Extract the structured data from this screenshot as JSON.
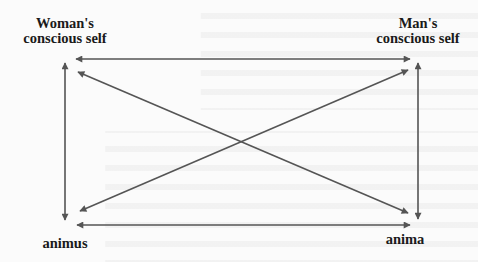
{
  "diagram": {
    "nodes": {
      "woman_conscious": {
        "line1": "Woman's",
        "line2": "conscious self"
      },
      "man_conscious": {
        "line1": "Man's",
        "line2": "conscious self"
      },
      "animus": {
        "label": "animus"
      },
      "anima": {
        "label": "anima"
      }
    },
    "edges": [
      {
        "from": "woman_conscious",
        "to": "man_conscious",
        "direction": "both"
      },
      {
        "from": "woman_conscious",
        "to": "animus",
        "direction": "both"
      },
      {
        "from": "man_conscious",
        "to": "anima",
        "direction": "both"
      },
      {
        "from": "animus",
        "to": "anima",
        "direction": "both"
      },
      {
        "from": "woman_conscious",
        "to": "anima",
        "direction": "both"
      },
      {
        "from": "man_conscious",
        "to": "animus",
        "direction": "both"
      }
    ],
    "colors": {
      "arrow": "#555555",
      "label": "#1a1a1a",
      "background": "#fbfbfb"
    }
  }
}
